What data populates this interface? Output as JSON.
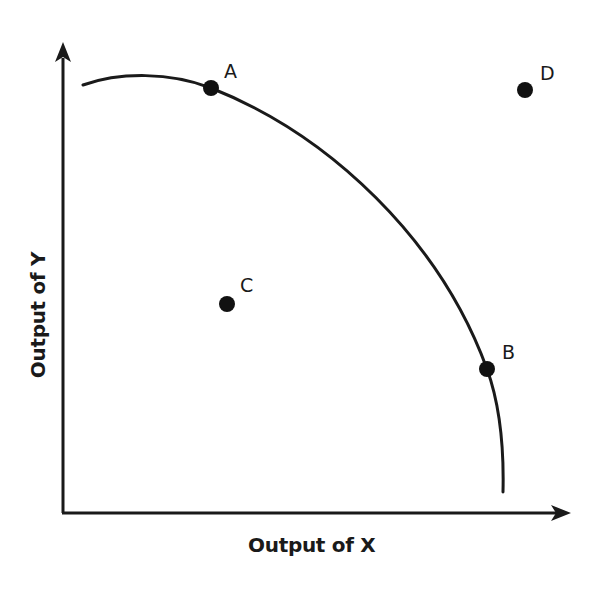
{
  "diagram": {
    "type": "production-possibilities-frontier",
    "x_axis": {
      "label": "Output of X"
    },
    "y_axis": {
      "label": "Output of Y"
    },
    "curve": {
      "description": "Concave production possibilities frontier",
      "color": "#1a1a1a"
    },
    "points": [
      {
        "id": "A",
        "label": "A",
        "position": "on frontier (high Y, low X)"
      },
      {
        "id": "B",
        "label": "B",
        "position": "on frontier (low Y, high X)"
      },
      {
        "id": "C",
        "label": "C",
        "position": "inside frontier"
      },
      {
        "id": "D",
        "label": "D",
        "position": "outside frontier"
      }
    ],
    "colors": {
      "ink": "#1a1a1a",
      "background": "#ffffff"
    }
  }
}
